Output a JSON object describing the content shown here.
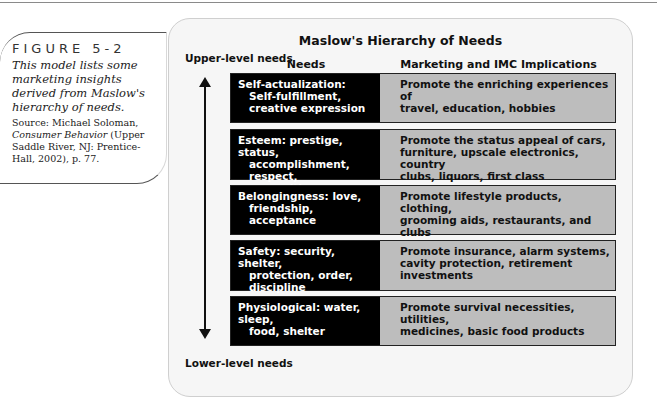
{
  "figure": {
    "label": "FIGURE 5-2",
    "description": "This model lists some marketing insights derived from Maslow's hierarchy of needs.",
    "source_prefix": "Source: Michael Soloman, ",
    "source_title": "Consumer Behavior",
    "source_suffix": " (Upper Saddle River, NJ: Prentice-Hall, 2002), p. 77."
  },
  "diagram": {
    "title": "Maslow's Hierarchy of Needs",
    "axis_top": "Upper-level needs",
    "axis_bottom": "Lower-level needs",
    "col_needs": "Needs",
    "col_impl": "Marketing and IMC Implications",
    "rows": [
      {
        "need_lines": [
          "Self-actualization:",
          "Self-fulfillment,",
          "creative expression"
        ],
        "impl_lines": [
          "Promote the enriching experiences of",
          "travel, education, hobbies"
        ]
      },
      {
        "need_lines": [
          "Esteem: prestige, status,",
          "accomplishment, respect,",
          "recognition"
        ],
        "impl_lines": [
          "Promote the status appeal of cars,",
          "furniture, upscale electronics, country",
          "clubs, liquors, first class"
        ]
      },
      {
        "need_lines": [
          "Belongingness: love,",
          "friendship, acceptance"
        ],
        "impl_lines": [
          "Promote lifestyle products, clothing,",
          "grooming aids, restaurants, and clubs"
        ]
      },
      {
        "need_lines": [
          "Safety: security, shelter,",
          "protection, order,",
          "discipline"
        ],
        "impl_lines": [
          "Promote insurance, alarm systems,",
          "cavity protection, retirement",
          "investments"
        ]
      },
      {
        "need_lines": [
          "Physiological: water, sleep,",
          "food, shelter"
        ],
        "impl_lines": [
          "Promote survival necessities, utilities,",
          "medicines, basic food products"
        ]
      }
    ]
  },
  "colors": {
    "need_bg": "#000000",
    "impl_bg": "#bdbdbd",
    "panel_bg": "#f6f6f6"
  }
}
